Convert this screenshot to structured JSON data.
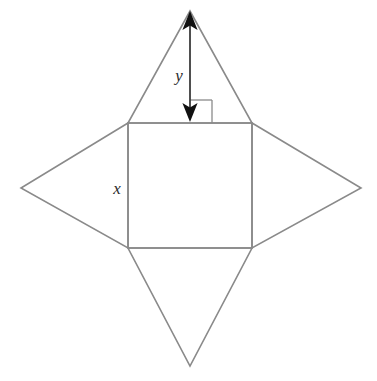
{
  "figure": {
    "background_color": "#ffffff",
    "outline_color": "#8a8a8a",
    "outline_width": 1.6,
    "arrow_color": "#3c3c3c",
    "arrow_head_color": "#111111",
    "right_angle_color": "#8a8a8a",
    "label_color": "#2b2b2b",
    "square": {
      "name": "central-square",
      "left": 128,
      "top": 123,
      "right": 252,
      "bottom": 248,
      "side_label": "x"
    },
    "triangles": [
      {
        "name": "top-triangle",
        "apex_x": 190,
        "apex_y": 11,
        "base": "top"
      },
      {
        "name": "right-triangle",
        "apex_x": 361,
        "apex_y": 188,
        "base": "right"
      },
      {
        "name": "bottom-triangle",
        "apex_x": 190,
        "apex_y": 366,
        "base": "bottom"
      },
      {
        "name": "left-triangle",
        "apex_x": 21,
        "apex_y": 188,
        "base": "left"
      }
    ],
    "height_arrow": {
      "name": "triangle-height-arrow",
      "x": 190,
      "y_top": 13,
      "y_bottom": 121,
      "label": "y"
    },
    "right_angle_mark": {
      "name": "right-angle-mark",
      "x": 190,
      "y": 100,
      "size": 22
    }
  },
  "labels": {
    "height_label": "y",
    "side_label": "x"
  }
}
